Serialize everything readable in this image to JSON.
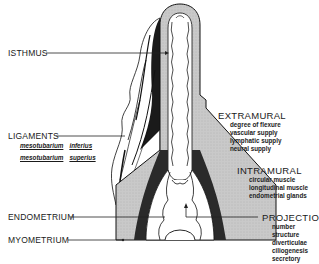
{
  "diagram": {
    "colors": {
      "muscle_fill": "#c8c8c8",
      "ligament_dark": "#1a1a1a",
      "line": "#222222",
      "background": "#ffffff"
    }
  },
  "labels": {
    "isthmus": "ISTHMUS",
    "ligaments": "LIGAMENTS",
    "ligament_items": [
      [
        "mesotubarium",
        "inferius"
      ],
      [
        "mesotubarium",
        "superius"
      ]
    ],
    "endometrium": "ENDOMETRIUM",
    "myometrium": "MYOMETRIUM",
    "extramural": {
      "title": "EXTRAMURAL",
      "items": [
        "degree of flexure",
        "vascular supply",
        "lymphatic supply",
        "neural supply"
      ]
    },
    "intramural": {
      "title": "INTRAMURAL",
      "items": [
        "circular muscle",
        "longitudinal muscle",
        "endometrial glands"
      ]
    },
    "projections": {
      "title": "PROJECTIONS",
      "items": [
        "number",
        "structure",
        "diverticulae",
        "ciliogenesis",
        "secretory"
      ]
    }
  }
}
